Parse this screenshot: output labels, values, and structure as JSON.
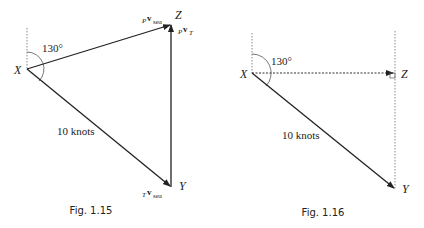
{
  "figures": [
    {
      "caption": "Fig. 1.15",
      "angle_label": "130°",
      "points": {
        "X": "X",
        "Y": "Y",
        "Z": "Z"
      },
      "side_label": "10 knots",
      "vectors": {
        "XZ": {
          "main": "P",
          "v": "v",
          "sub": "sea"
        },
        "YZ": {
          "main": "P",
          "v": "v",
          "sub": "T"
        },
        "XY": {
          "main": "T",
          "v": "v",
          "sub": "sea"
        }
      }
    },
    {
      "caption": "Fig. 1.16",
      "angle_label": "130°",
      "points": {
        "X": "X",
        "Y": "Y",
        "Z": "Z"
      },
      "side_label": "10 knots"
    }
  ],
  "colors": {
    "line": "#222222",
    "dotted": "#888888"
  }
}
